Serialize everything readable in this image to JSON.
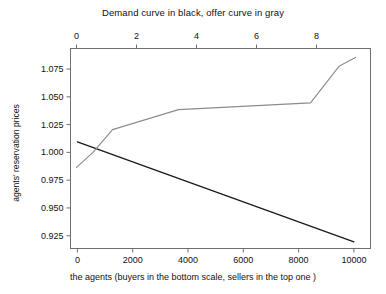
{
  "chart_data": {
    "type": "line",
    "title": "Demand curve in black, offer curve in gray",
    "xlabel": "the agents (buyers in the bottom scale, sellers in the top one )",
    "ylabel": "agents' reservation prices",
    "grid": false,
    "legend": "none",
    "axes": {
      "bottom": {
        "label": "the agents (buyers in the bottom scale, sellers in the top one )",
        "ticks": [
          0,
          2000,
          4000,
          6000,
          8000,
          10000
        ],
        "tick_labels": [
          "0",
          "2000",
          "4000",
          "6000",
          "8000",
          "10000"
        ],
        "range": [
          -250,
          10600
        ]
      },
      "top": {
        "ticks": [
          0,
          2,
          4,
          6,
          8
        ],
        "tick_labels": [
          "0",
          "2",
          "4",
          "6",
          "8"
        ],
        "range": [
          -0.2,
          9.8
        ]
      },
      "left": {
        "label": "agents' reservation prices",
        "ticks": [
          0.925,
          0.95,
          0.975,
          1.0,
          1.025,
          1.05,
          1.075
        ],
        "tick_labels": [
          "0.925",
          "0.950",
          "0.975",
          "1.000",
          "1.025",
          "1.050",
          "1.075"
        ],
        "range": [
          0.9135,
          1.0935
        ]
      }
    },
    "series": [
      {
        "name": "Demand curve",
        "color": "#1a1a1a",
        "scale": "bottom",
        "x": [
          0,
          10000
        ],
        "values": [
          1.0095,
          0.9195
        ]
      },
      {
        "name": "Offer curve",
        "color": "#8c8c8c",
        "scale": "top",
        "x": [
          0.0,
          0.55,
          1.2,
          3.4,
          7.8,
          8.75,
          9.3
        ],
        "values": [
          0.9865,
          1.0,
          1.0205,
          1.0385,
          1.0445,
          1.0775,
          1.0855
        ]
      }
    ]
  }
}
